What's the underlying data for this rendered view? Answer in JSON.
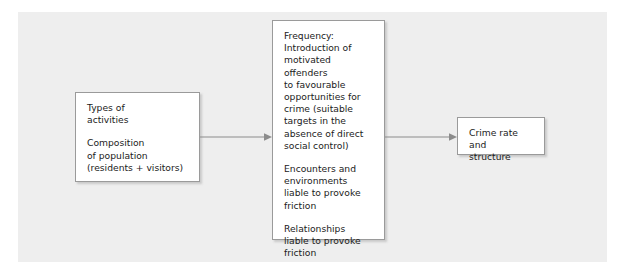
{
  "diagram": {
    "type": "flowchart",
    "background_color": "#eeeeee",
    "box_fill": "#ffffff",
    "box_border_color": "#9a9a9a",
    "connector_color": "#8c8c8c",
    "boxes": [
      {
        "id": "activities",
        "name": "types-of-activities-box",
        "paragraphs": [
          "Types of\nactivities",
          "Composition\nof population\n(residents + visitors)"
        ]
      },
      {
        "id": "frequency",
        "name": "frequency-box",
        "paragraphs": [
          "Frequency:\nIntroduction of\nmotivated offenders\nto favourable\nopportunities for\ncrime (suitable\ntargets in the\nabsence of direct\nsocial control)",
          "Encounters and\nenvironments\nliable to provoke\nfriction",
          "Relationships\nliable to provoke\nfriction"
        ]
      },
      {
        "id": "crime-rate",
        "name": "crime-rate-box",
        "paragraphs": [
          "Crime rate and\nstructure"
        ]
      }
    ],
    "connectors": [
      {
        "id": "activities-to-frequency",
        "from": "activities",
        "to": "frequency",
        "style": "arrow"
      },
      {
        "id": "frequency-to-crime-rate",
        "from": "frequency",
        "to": "crime-rate",
        "style": "arrow"
      }
    ]
  }
}
